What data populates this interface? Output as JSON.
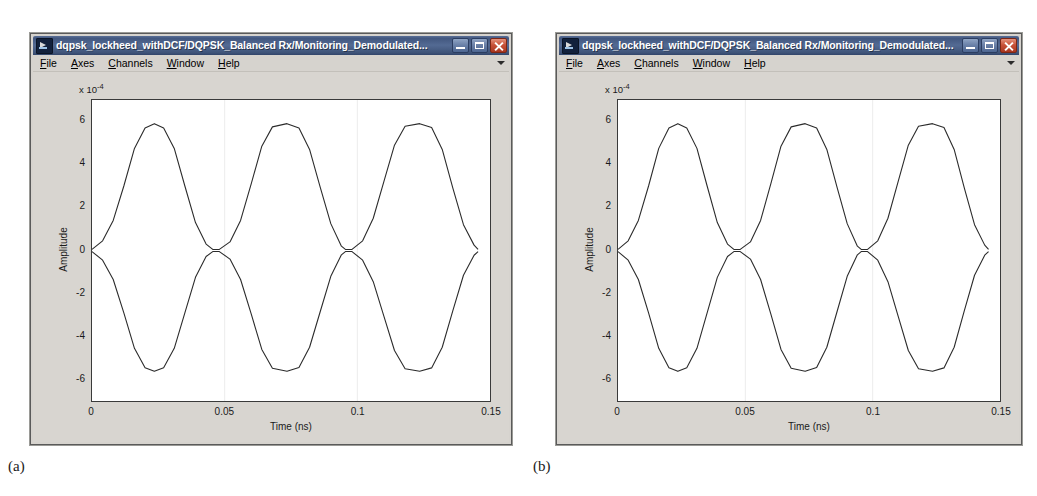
{
  "page": {
    "background": "#ffffff",
    "captions": [
      {
        "text": "(a)",
        "x": 8,
        "y": 458
      },
      {
        "text": "(b)",
        "x": 533,
        "y": 458
      }
    ]
  },
  "window_chrome": {
    "title": "dqpsk_lockheed_withDCF/DQPSK_Balanced Rx/Monitoring_Demodulated...",
    "icon": "scope-waveform-icon",
    "buttons": [
      {
        "name": "minimize-button",
        "glyph": "minimize-icon"
      },
      {
        "name": "maximize-button",
        "glyph": "maximize-icon"
      },
      {
        "name": "close-button",
        "glyph": "close-icon"
      }
    ],
    "menu": [
      {
        "label": "File",
        "mnemonic": "F"
      },
      {
        "label": "Axes",
        "mnemonic": "A"
      },
      {
        "label": "Channels",
        "mnemonic": "C"
      },
      {
        "label": "Window",
        "mnemonic": "W"
      },
      {
        "label": "Help",
        "mnemonic": "H"
      }
    ],
    "overflow_indicator": "chevron-down-icon",
    "colors": {
      "titlebar_active": "#42577f",
      "face": "#d6d3ce",
      "close_button": "#c9533a",
      "figure_face": "#d8d5d0",
      "axes_face": "#ffffff",
      "trace": "#2b2b2b"
    }
  },
  "windows": [
    {
      "id": "window-a",
      "x": 30,
      "y": 33,
      "w": 482,
      "h": 412
    },
    {
      "id": "window-b",
      "x": 556,
      "y": 33,
      "w": 466,
      "h": 412
    }
  ],
  "chart_data": {
    "type": "line",
    "title": "",
    "xlabel": "Time (ns)",
    "ylabel": "Amplitude",
    "y_multiplier": "x 10",
    "y_multiplier_exponent": "-4",
    "xlim": [
      0,
      0.15
    ],
    "ylim": [
      -7,
      7
    ],
    "xticks": [
      0,
      0.05,
      0.1,
      0.15
    ],
    "xtick_labels": [
      "0",
      "0.05",
      "0.1",
      "0.15"
    ],
    "yticks": [
      6,
      4,
      2,
      0,
      -2,
      -4,
      -6
    ],
    "ytick_labels": [
      "6",
      "4",
      "2",
      "0",
      "-2",
      "-4",
      "-6"
    ],
    "grid": false,
    "legend": "none",
    "series": [
      {
        "name": "Demodulated signal (upper envelope)",
        "color": "#2b2b2b",
        "description": "Three positive raised-cosine pulses peaking at +5.9e-4, pinched to 0 between pulses",
        "peak_value": 5.9,
        "pulse_centers": [
          0.0235,
          0.0735,
          0.1235
        ],
        "zero_crossings": [
          0.0,
          0.0455,
          0.0955,
          0.1455
        ]
      },
      {
        "name": "Demodulated signal (lower envelope)",
        "color": "#2b2b2b",
        "description": "Mirror image: three negative pulses troughing at -5.6e-4",
        "peak_value": -5.6,
        "pulse_centers": [
          0.0235,
          0.0735,
          0.1235
        ],
        "zero_crossings": [
          0.0,
          0.0455,
          0.0955,
          0.1455
        ]
      }
    ],
    "sampled_points": {
      "x": [
        0.0,
        0.004,
        0.008,
        0.012,
        0.016,
        0.02,
        0.0235,
        0.027,
        0.031,
        0.035,
        0.039,
        0.043,
        0.0455,
        0.048,
        0.052,
        0.056,
        0.06,
        0.064,
        0.068,
        0.0735,
        0.078,
        0.082,
        0.086,
        0.09,
        0.094,
        0.0955,
        0.098,
        0.102,
        0.106,
        0.11,
        0.114,
        0.118,
        0.1235,
        0.128,
        0.132,
        0.136,
        0.14,
        0.144,
        0.1455
      ],
      "upper": [
        0.05,
        0.45,
        1.4,
        3.0,
        4.75,
        5.7,
        5.9,
        5.7,
        4.75,
        3.0,
        1.3,
        0.3,
        0.05,
        0.05,
        0.4,
        1.4,
        3.1,
        4.85,
        5.75,
        5.9,
        5.7,
        4.7,
        2.95,
        1.25,
        0.2,
        0.05,
        0.05,
        0.45,
        1.5,
        3.2,
        4.9,
        5.78,
        5.9,
        5.72,
        4.7,
        2.9,
        1.2,
        0.25,
        0.05
      ],
      "lower": [
        -0.05,
        -0.45,
        -1.35,
        -2.9,
        -4.55,
        -5.45,
        -5.62,
        -5.45,
        -4.55,
        -2.9,
        -1.25,
        -0.28,
        -0.05,
        -0.05,
        -0.4,
        -1.35,
        -2.95,
        -4.6,
        -5.48,
        -5.62,
        -5.44,
        -4.5,
        -2.85,
        -1.2,
        -0.2,
        -0.05,
        -0.05,
        -0.45,
        -1.45,
        -3.05,
        -4.65,
        -5.5,
        -5.62,
        -5.46,
        -4.5,
        -2.8,
        -1.15,
        -0.22,
        -0.05
      ]
    }
  }
}
